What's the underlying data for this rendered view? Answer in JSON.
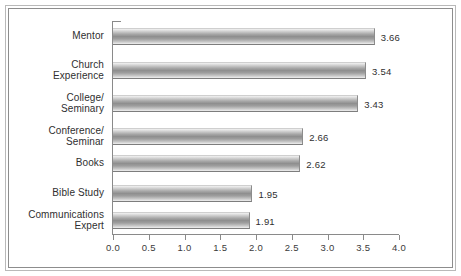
{
  "chart_data": {
    "type": "bar",
    "orientation": "horizontal",
    "title": "",
    "xlabel": "",
    "ylabel": "",
    "xlim": [
      0.0,
      4.0
    ],
    "xticks": [
      "0.0",
      "0.5",
      "1.0",
      "1.5",
      "2.0",
      "2.5",
      "3.0",
      "3.5",
      "4.0"
    ],
    "xtick_values": [
      0.0,
      0.5,
      1.0,
      1.5,
      2.0,
      2.5,
      3.0,
      3.5,
      4.0
    ],
    "grid": false,
    "legend": null,
    "categories": [
      "Mentor",
      "Church\nExperience",
      "College/\nSeminary",
      "Conference/\nSeminar",
      "Books",
      "Bible Study",
      "Communications\nExpert"
    ],
    "values": [
      3.66,
      3.54,
      3.43,
      2.66,
      2.62,
      1.95,
      1.91
    ],
    "value_labels": [
      "3.66",
      "3.54",
      "3.43",
      "2.66",
      "2.62",
      "1.95",
      "1.91"
    ],
    "bar_color": "#9e9e9e",
    "axis_color": "#8a8a8a",
    "text_color": "#2f2f2f",
    "frame_color": "#8d8d8d",
    "background_color": "#ffffff"
  }
}
